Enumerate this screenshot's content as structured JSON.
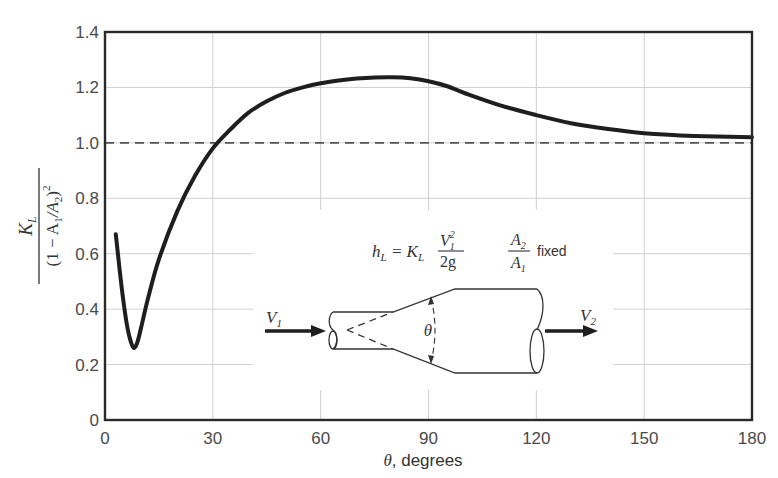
{
  "chart_data": {
    "type": "line",
    "title": "",
    "xlabel": "θ, degrees",
    "ylabel": "K_L / (1 − A1/A2)^2",
    "xlim": [
      0,
      180
    ],
    "ylim": [
      0,
      1.4
    ],
    "x_ticks": [
      0,
      30,
      60,
      90,
      120,
      150,
      180
    ],
    "y_ticks": [
      0,
      0.2,
      0.4,
      0.6,
      0.8,
      1.0,
      1.2,
      1.4
    ],
    "x_tick_labels": [
      "0",
      "30",
      "60",
      "90",
      "120",
      "150",
      "180"
    ],
    "y_tick_labels": [
      "0",
      "0.2",
      "0.4",
      "0.6",
      "0.8",
      "1.0",
      "1.2",
      "1.4"
    ],
    "grid": true,
    "legend": null,
    "series": [
      {
        "name": "K_L / (1 − A1/A2)^2 vs θ",
        "style": "solid-thick",
        "x": [
          3,
          4,
          5,
          6,
          7,
          8,
          9,
          10,
          12,
          15,
          20,
          25,
          30,
          35,
          40,
          45,
          50,
          55,
          60,
          65,
          70,
          75,
          80,
          85,
          90,
          95,
          100,
          110,
          120,
          130,
          140,
          150,
          160,
          170,
          180
        ],
        "y": [
          0.67,
          0.55,
          0.44,
          0.35,
          0.29,
          0.26,
          0.28,
          0.33,
          0.44,
          0.58,
          0.75,
          0.88,
          0.98,
          1.05,
          1.11,
          1.15,
          1.18,
          1.2,
          1.215,
          1.225,
          1.232,
          1.236,
          1.237,
          1.233,
          1.222,
          1.205,
          1.18,
          1.135,
          1.1,
          1.07,
          1.05,
          1.035,
          1.027,
          1.023,
          1.02
        ]
      },
      {
        "name": "reference",
        "style": "dashed",
        "x": [
          0,
          180
        ],
        "y": [
          1.0,
          1.0
        ]
      }
    ],
    "annotations": {
      "formula": "h_L = K_L V1^2 / 2g",
      "ratio_note": "A2/A1 fixed",
      "inlet_velocity": "V1",
      "outlet_velocity": "V2",
      "angle": "θ"
    }
  },
  "labels": {
    "x_axis": "θ, degrees",
    "x_axis_theta": "θ",
    "x_axis_rest": ", degrees",
    "y_axis_num_K": "K",
    "y_axis_num_sub": "L",
    "y_axis_den": "(1 − A",
    "y_axis_den_sub1": "1",
    "y_axis_den_mid": "/A",
    "y_axis_den_sub2": "2",
    "y_axis_den_end": ")",
    "y_axis_den_sup": "2"
  },
  "diagram": {
    "formula_h": "h",
    "formula_h_sub": "L",
    "formula_eq": " = ",
    "formula_K": "K",
    "formula_K_sub": "L",
    "formula_num_V": "V",
    "formula_num_sub": "1",
    "formula_num_sup": "2",
    "formula_den": "2g",
    "ratio_num_A": "A",
    "ratio_num_sub": "2",
    "ratio_den_A": "A",
    "ratio_den_sub": "1",
    "ratio_fixed": "fixed",
    "v1": "V",
    "v1_sub": "1",
    "v2": "V",
    "v2_sub": "2",
    "theta": "θ"
  },
  "colors": {
    "curve": "#1e1e1e",
    "frame": "#2a2a2a",
    "grid": "#cfcfcf",
    "dashed": "#555555",
    "text": "#4a4a4a"
  }
}
